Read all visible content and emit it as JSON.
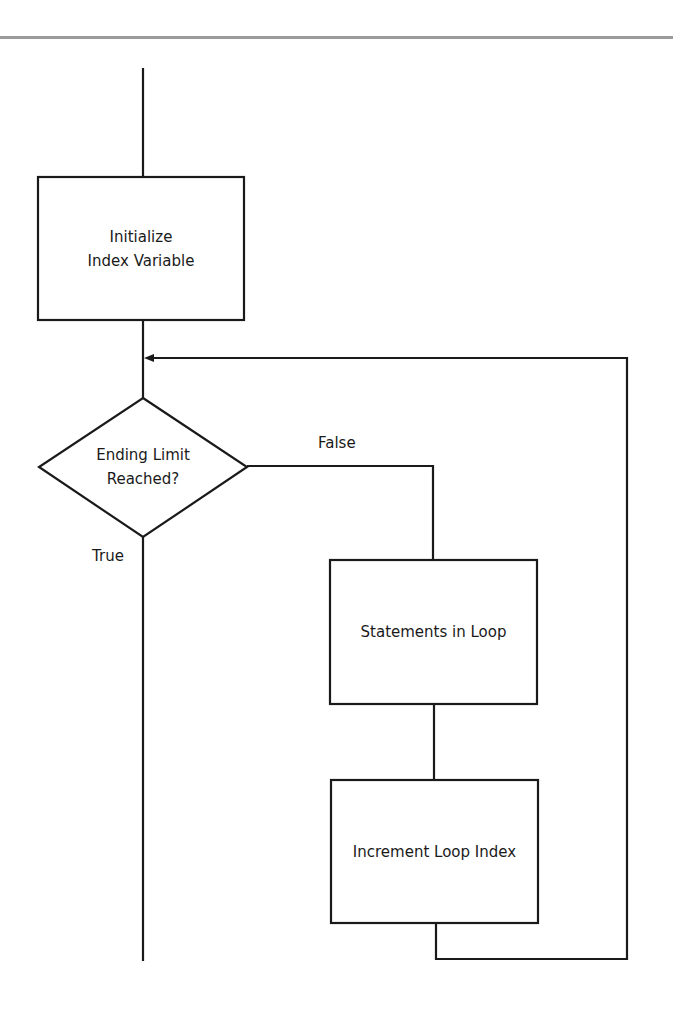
{
  "diagram": {
    "type": "flowchart",
    "title": "",
    "nodes": [
      {
        "id": "init",
        "shape": "rectangle",
        "line1": "Initialize",
        "line2": "Index Variable"
      },
      {
        "id": "decision",
        "shape": "diamond",
        "line1": "Ending Limit",
        "line2": "Reached?"
      },
      {
        "id": "statements",
        "shape": "rectangle",
        "label": "Statements in Loop"
      },
      {
        "id": "increment",
        "shape": "rectangle",
        "label": "Increment Loop Index"
      }
    ],
    "edges": [
      {
        "from": "start",
        "to": "init",
        "label": ""
      },
      {
        "from": "init",
        "to": "decision",
        "label": ""
      },
      {
        "from": "decision",
        "to": "statements",
        "label": "False"
      },
      {
        "from": "decision",
        "to": "end",
        "label": "True"
      },
      {
        "from": "statements",
        "to": "increment",
        "label": ""
      },
      {
        "from": "increment",
        "to": "decision",
        "label": "",
        "arrow": true
      }
    ],
    "labels": {
      "false": "False",
      "true": "True"
    },
    "colors": {
      "line": "#1a1a1a",
      "rule": "#9a9a9a",
      "background": "#ffffff"
    }
  }
}
